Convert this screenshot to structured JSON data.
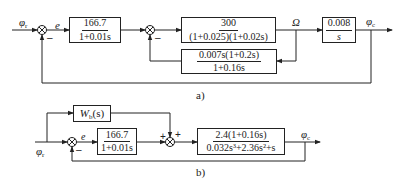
{
  "diagram_a": {
    "caption": "a)",
    "input_label": "φ",
    "input_sub": "r",
    "error_label": "e",
    "omega_label": "Ω",
    "output_label": "φ",
    "output_sub": "c",
    "sum1_sign": "–",
    "sum2_sign": "–",
    "blocks": [
      {
        "id": "G1",
        "numerator": "166.7",
        "denominator": "1+0.01s"
      },
      {
        "id": "G2",
        "numerator": "300",
        "denominator": "(1+0.025)(1+0.02s)"
      },
      {
        "id": "G3",
        "numerator": "0.008",
        "denominator": "s"
      },
      {
        "id": "H1",
        "numerator": "0.007s(1+0.2s)",
        "denominator": "1+0.16s"
      }
    ]
  },
  "diagram_b": {
    "caption": "b)",
    "input_label": "φ",
    "input_sub": "r",
    "error_label": "e",
    "output_label": "φ",
    "output_sub": "c",
    "sum1_sign": "–",
    "sum2_sign_left": "+",
    "sum2_sign_top": "+",
    "blocks": [
      {
        "id": "Wb",
        "label": "W",
        "label_sub": "b",
        "label_suffix": "(s)"
      },
      {
        "id": "G1",
        "numerator": "166.7",
        "denominator": "1+0.01s"
      },
      {
        "id": "G2",
        "numerator": "2.4(1+0.16s)",
        "denominator": "0.032s³+2.36s²+s"
      }
    ]
  },
  "colors": {
    "line": "#222222",
    "background": "#ffffff"
  }
}
